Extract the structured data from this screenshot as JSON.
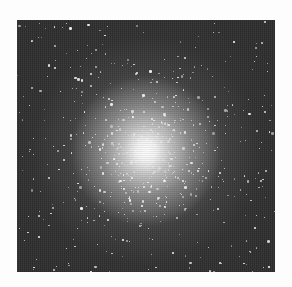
{
  "image": {
    "subject": "globular star cluster",
    "colors": {
      "page_background": "#fdfdfd",
      "sky_background": "#2e2e2e",
      "core": "#ffffff",
      "star": "#f2f2f2"
    },
    "frame": {
      "left": 17,
      "top": 20,
      "width": 258,
      "height": 252
    },
    "core_center": {
      "x_pct": 50,
      "y_pct": 52
    },
    "stars": {
      "count": 700,
      "seed": 42,
      "spread_px": 95
    }
  }
}
